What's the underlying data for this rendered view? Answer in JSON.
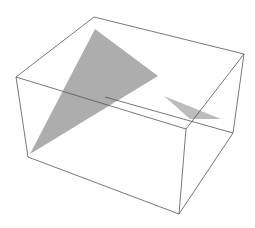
{
  "figure": {
    "type": "3d-plot",
    "width": 255,
    "height": 228,
    "background": "#ffffff",
    "box_edge_color": "#555555",
    "polygon_color": "#a9a9a9",
    "box": {
      "vertices": {
        "top_back_left": [
          94,
          17
        ],
        "top_back_right": [
          244,
          54
        ],
        "top_front_left": [
          16,
          77
        ],
        "top_front_right": [
          186,
          129
        ],
        "bottom_front_left": [
          28,
          157
        ],
        "bottom_front_right": [
          179,
          214
        ],
        "bottom_back_right": [
          233,
          133
        ],
        "bottom_back_left": [
          105,
          97
        ]
      },
      "edges": [
        [
          "top_back_left",
          "top_back_right"
        ],
        [
          "top_back_left",
          "top_front_left"
        ],
        [
          "top_back_right",
          "top_front_right"
        ],
        [
          "top_front_left",
          "top_front_right"
        ],
        [
          "top_front_left",
          "bottom_front_left"
        ],
        [
          "top_front_right",
          "bottom_front_right"
        ],
        [
          "bottom_front_left",
          "bottom_front_right"
        ],
        [
          "top_back_right",
          "bottom_back_right"
        ],
        [
          "bottom_front_right",
          "bottom_back_right"
        ],
        [
          "bottom_back_left",
          "bottom_back_right"
        ]
      ]
    },
    "polygons": [
      {
        "name": "large-triangle",
        "points": [
          [
            95,
            29
          ],
          [
            158,
            76
          ],
          [
            30,
            154
          ]
        ],
        "color": "#a9a9a9",
        "opacity": 0.95
      },
      {
        "name": "small-triangle",
        "points": [
          [
            164,
            96
          ],
          [
            221,
            119
          ],
          [
            190,
            119
          ]
        ],
        "color": "#b5b5b5",
        "opacity": 0.9
      }
    ]
  }
}
